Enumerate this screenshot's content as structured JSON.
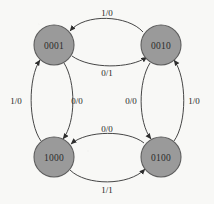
{
  "diagram": {
    "background_color": "#f8f8f6",
    "node_fill_color": "#9a9a9a",
    "node_stroke_color": "#5d5d5d",
    "edge_color": "#3c3c3c",
    "states": [
      {
        "id": "s0001",
        "label": "0001",
        "cx": 54,
        "cy": 45,
        "r": 20
      },
      {
        "id": "s0010",
        "label": "0010",
        "cx": 161,
        "cy": 45,
        "r": 20
      },
      {
        "id": "s1000",
        "label": "1000",
        "cx": 54,
        "cy": 157,
        "r": 20
      },
      {
        "id": "s0100",
        "label": "0100",
        "cx": 161,
        "cy": 157,
        "r": 20
      }
    ],
    "transitions": [
      {
        "id": "t-0010-0001",
        "from": "0010",
        "to": "0001",
        "label": "1/0",
        "label_x": 107,
        "label_y": 13,
        "position": "top-outer"
      },
      {
        "id": "t-0001-0010",
        "from": "0001",
        "to": "0010",
        "label": "0/1",
        "label_x": 107,
        "label_y": 73,
        "position": "top-inner"
      },
      {
        "id": "t-1000-0001",
        "from": "1000",
        "to": "0001",
        "label": "1/0",
        "label_x": 16,
        "label_y": 101,
        "position": "left-outer"
      },
      {
        "id": "t-0001-1000",
        "from": "0001",
        "to": "1000",
        "label": "0/0",
        "label_x": 77,
        "label_y": 101,
        "position": "left-inner"
      },
      {
        "id": "t-0010-0100",
        "from": "0010",
        "to": "0100",
        "label": "0/0",
        "label_x": 131,
        "label_y": 101,
        "position": "right-inner"
      },
      {
        "id": "t-0100-0010",
        "from": "0100",
        "to": "0010",
        "label": "1/0",
        "label_x": 194,
        "label_y": 101,
        "position": "right-outer"
      },
      {
        "id": "t-0100-1000",
        "from": "0100",
        "to": "1000",
        "label": "0/0",
        "label_x": 107,
        "label_y": 129,
        "position": "bottom-inner"
      },
      {
        "id": "t-1000-0100",
        "from": "1000",
        "to": "0100",
        "label": "1/1",
        "label_x": 107,
        "label_y": 190,
        "position": "bottom-outer"
      }
    ]
  }
}
